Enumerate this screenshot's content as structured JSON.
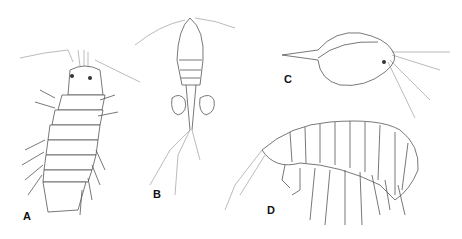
{
  "figure": {
    "panels": [
      {
        "label": "A",
        "subject": "isopod (dorsal view)"
      },
      {
        "label": "B",
        "subject": "copepod with egg sacs"
      },
      {
        "label": "C",
        "subject": "cladoceran (water flea)"
      },
      {
        "label": "D",
        "subject": "amphipod (lateral view)"
      }
    ]
  }
}
